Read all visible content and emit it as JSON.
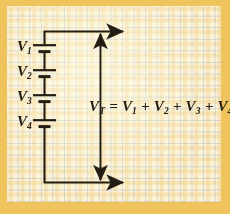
{
  "figure": {
    "paper": {
      "border_color": "#f0c45c",
      "sheet_color": "#fbf3d8",
      "grid_line_color": "#96a0be",
      "ink_color": "#241d14"
    }
  },
  "battery": {
    "cell_count": 4,
    "cells": [
      {
        "name": "V1",
        "label_main": "V",
        "label_sub": "1"
      },
      {
        "name": "V2",
        "label_main": "V",
        "label_sub": "2"
      },
      {
        "name": "V3",
        "label_main": "V",
        "label_sub": "3"
      },
      {
        "name": "V4",
        "label_main": "V",
        "label_sub": "4"
      }
    ]
  },
  "equation": {
    "full_text": "VT = V1 + V2 + V3 + V4",
    "lhs_main": "V",
    "lhs_sub": "T",
    "equals": "=",
    "terms": [
      {
        "main": "V",
        "sub": "1"
      },
      {
        "main": "V",
        "sub": "2"
      },
      {
        "main": "V",
        "sub": "3"
      },
      {
        "main": "V",
        "sub": "4"
      }
    ],
    "plus": "+"
  },
  "arrows": {
    "top_terminal": "top-lead-arrow-right",
    "bottom_terminal": "bottom-lead-arrow-right",
    "measure_up": "vt-arrow-up",
    "measure_down": "vt-arrow-down"
  }
}
